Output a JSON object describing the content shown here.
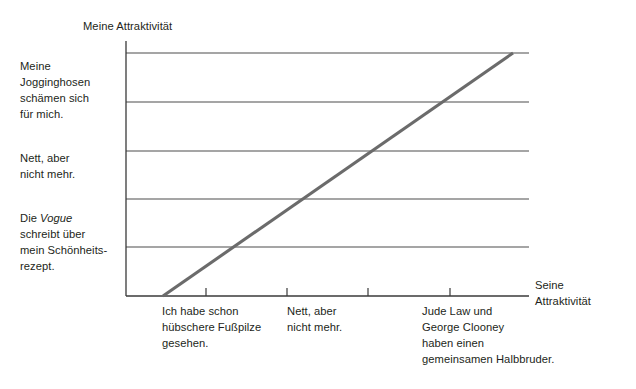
{
  "chart": {
    "type": "line",
    "y_axis_title": "Meine Attraktivität",
    "x_axis_title": "Seine\nAttraktivität",
    "y_tick_labels": [
      "Die Vogue\nschreibt über\nmein Schönheits-\nrezept.",
      "Nett, aber\nnicht mehr.",
      "Meine\nJogginghosen\nschämen sich\nfür mich."
    ],
    "x_tick_labels": [
      "Ich habe schon\nhübschere Fußpilze\ngesehen.",
      "Nett, aber\nnicht mehr.",
      "Jude Law und\nGeorge Clooney\nhaben einen\ngemeinsamen Halbbruder."
    ],
    "y_tick_label_italic_word": "Vogue",
    "colors": {
      "line": "#6b6b6b",
      "grid": "#4d4d4d",
      "axis": "#3a3a3a",
      "text": "#231f20",
      "background": "#ffffff"
    }
  },
  "chart_data": {
    "type": "line",
    "title": "",
    "subtitle": "",
    "xlabel": "Seine Attraktivität",
    "ylabel": "Meine Attraktivität",
    "grid": true,
    "legend": false,
    "xlim": [
      0,
      5
    ],
    "ylim": [
      0,
      5
    ],
    "x_ticks": [
      1,
      2,
      3,
      4
    ],
    "x_tick_labels": [
      "Ich habe schon hübschere Fußpilze gesehen.",
      "Nett, aber nicht mehr.",
      "",
      "Jude Law und George Clooney haben einen gemeinsamen Halbbruder."
    ],
    "y_ticks": [
      1,
      2,
      3,
      4,
      5
    ],
    "y_tick_labels": [
      "Die Vogue schreibt über mein Schönheitsrezept.",
      "",
      "Nett, aber nicht mehr.",
      "",
      "Meine Jogginghosen schämen sich für mich."
    ],
    "series": [
      {
        "name": "Attraktivitätsverhältnis",
        "x": [
          0.45,
          5.0
        ],
        "y": [
          0.0,
          5.0
        ]
      }
    ],
    "annotations": []
  }
}
